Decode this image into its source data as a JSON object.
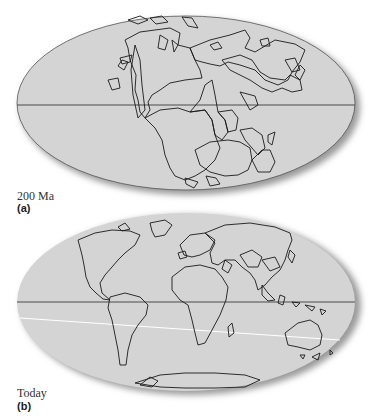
{
  "figure": {
    "panels": [
      {
        "id": "a",
        "time_label": "200 Ma",
        "panel_label": "(a)",
        "description": "Pangaea supercontinent on Mollweide-style elliptical world map with equator line"
      },
      {
        "id": "b",
        "time_label": "Today",
        "panel_label": "(b)",
        "description": "Present-day continents on Mollweide-style elliptical world map with equator line"
      }
    ],
    "colors": {
      "ocean_fill": "#d4d4d4",
      "coastline": "#1a1a1a",
      "equator": "#4a4a4a",
      "shadow": "#9a9a9a",
      "highlight_line": "#ffffff"
    }
  }
}
